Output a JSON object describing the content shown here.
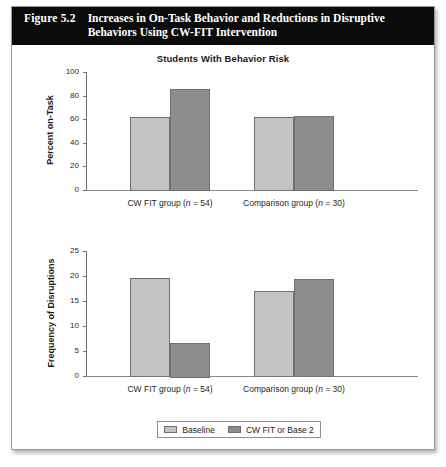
{
  "header": {
    "figure_number": "Figure 5.2",
    "caption": "Increases in On-Task Behavior and Reductions in Disruptive Behaviors Using CW-FIT Intervention"
  },
  "legend": {
    "items": [
      {
        "label": "Baseline",
        "color": "#c3c3c3"
      },
      {
        "label": "CW FIT or Base 2",
        "color": "#8d8d8d"
      }
    ]
  },
  "chart_data": [
    {
      "type": "bar",
      "title": "Students With Behavior Risk",
      "xlabel": "",
      "ylabel": "Percent on-Task",
      "ylim": [
        0,
        100
      ],
      "yticks": [
        0,
        20,
        40,
        60,
        80,
        100
      ],
      "ytick_labels": [
        "0",
        "20",
        "40",
        "60",
        "80",
        "100"
      ],
      "grid": false,
      "legend_position": "bottom",
      "categories": [
        "CW FIT group (n = 54)",
        "Comparison group (n = 30)"
      ],
      "category_parts": [
        {
          "name": "CW FIT group",
          "n_label": "n",
          "n_value": "= 54"
        },
        {
          "name": "Comparison group",
          "n_label": "n",
          "n_value": "= 30"
        }
      ],
      "series": [
        {
          "name": "Baseline",
          "color": "#c3c3c3",
          "values": [
            62,
            61.5
          ]
        },
        {
          "name": "CW FIT or Base 2",
          "color": "#8d8d8d",
          "values": [
            86,
            63
          ]
        }
      ]
    },
    {
      "type": "bar",
      "title": "",
      "xlabel": "",
      "ylabel": "Frequency of Disruptions",
      "ylim": [
        0,
        25
      ],
      "yticks": [
        0,
        5,
        10,
        15,
        20,
        25
      ],
      "ytick_labels": [
        "0",
        "5",
        "10",
        "15",
        "20",
        "25"
      ],
      "grid": false,
      "legend_position": "bottom",
      "categories": [
        "CW FIT group (n = 54)",
        "Comparison group (n = 30)"
      ],
      "category_parts": [
        {
          "name": "CW FIT group",
          "n_label": "n",
          "n_value": "= 54"
        },
        {
          "name": "Comparison group",
          "n_label": "n",
          "n_value": "= 30"
        }
      ],
      "series": [
        {
          "name": "Baseline",
          "color": "#c3c3c3",
          "values": [
            19.6,
            17
          ]
        },
        {
          "name": "CW FIT or Base 2",
          "color": "#8d8d8d",
          "values": [
            6.7,
            19.4
          ]
        }
      ]
    }
  ]
}
